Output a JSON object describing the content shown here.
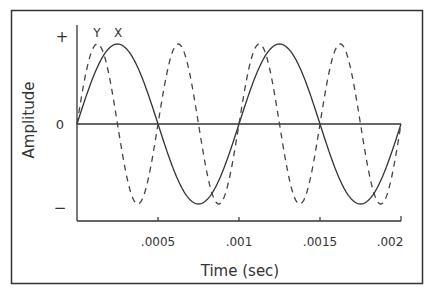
{
  "chart_data": {
    "type": "line",
    "title": "",
    "xlabel": "Time (sec)",
    "ylabel": "Amplitude",
    "xlim": [
      0,
      0.002
    ],
    "ylim": [
      -1,
      1
    ],
    "x_ticks": [
      0.0005,
      0.001,
      0.0015,
      0.002
    ],
    "x_tick_labels": [
      ".0005",
      ".001",
      ".0015",
      ".002"
    ],
    "y_tick_labels": [
      "+",
      "0",
      "−"
    ],
    "grid": false,
    "series": [
      {
        "name": "X",
        "style": "solid",
        "function": "sin",
        "frequency_hz": 1000,
        "amplitude": 1,
        "phase": 0
      },
      {
        "name": "Y",
        "style": "dashed",
        "function": "sin",
        "frequency_hz": 2000,
        "amplitude": 1,
        "phase": 0
      }
    ],
    "annotations": [
      {
        "text": "Y",
        "x": 0.00013,
        "position": "above peak"
      },
      {
        "text": "X",
        "x": 0.00026,
        "position": "above peak"
      }
    ],
    "legend": "inline labels above first peaks"
  },
  "labels": {
    "ylabel": "Amplitude",
    "xlabel": "Time (sec)",
    "y_plus": "+",
    "y_zero": "0",
    "y_minus": "−",
    "x_ticks": [
      ".0005",
      ".001",
      ".0015",
      ".002"
    ],
    "series_y": "Y",
    "series_x": "X"
  }
}
